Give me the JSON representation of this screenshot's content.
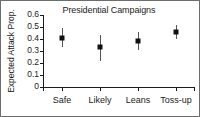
{
  "chart_data": {
    "type": "scatter",
    "title": "Presidential Campaigns",
    "xlabel": "",
    "ylabel": "Expected Attack Prop.",
    "categories": [
      "Safe",
      "Likely",
      "Leans",
      "Toss-up"
    ],
    "values": [
      0.41,
      0.33,
      0.385,
      0.46
    ],
    "error_low": [
      0.33,
      0.22,
      0.31,
      0.4
    ],
    "error_high": [
      0.49,
      0.43,
      0.46,
      0.52
    ],
    "ylim": [
      0,
      0.6
    ],
    "yticks": [
      0,
      0.1,
      0.2,
      0.3,
      0.4,
      0.5,
      0.6
    ],
    "ytick_labels": [
      "0",
      "0.1",
      "0.2",
      "0.3",
      "0.4",
      "0.5",
      "0.6"
    ],
    "grid": false,
    "legend": null,
    "marker_style": "filled-square",
    "colors": {
      "marker": "#111111",
      "error_bar": "#555555",
      "axis": "#1a1a1a",
      "background": "#ffffff",
      "frame": "#6d6d6d"
    }
  }
}
